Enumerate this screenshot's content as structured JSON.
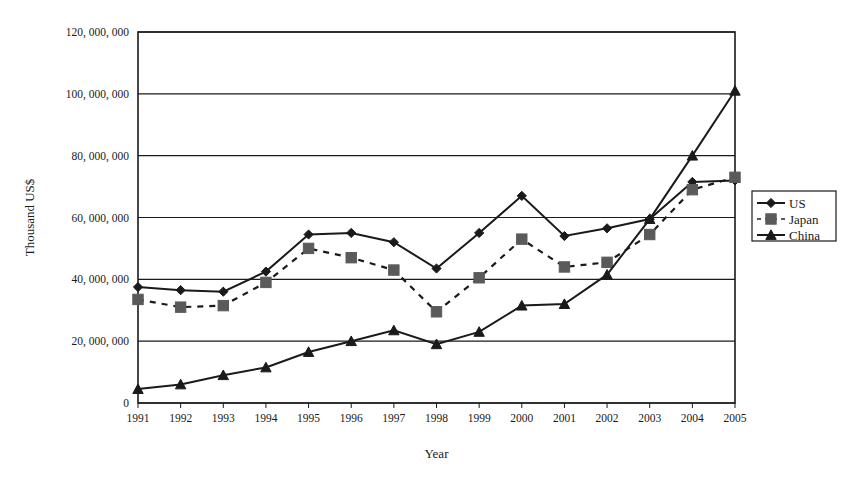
{
  "chart_data": {
    "type": "line",
    "title": "",
    "xlabel": "Year",
    "ylabel": "Thousand US$",
    "categories": [
      "1991",
      "1992",
      "1993",
      "1994",
      "1995",
      "1996",
      "1997",
      "1998",
      "1999",
      "2000",
      "2001",
      "2002",
      "2003",
      "2004",
      "2005"
    ],
    "x": [
      1991,
      1992,
      1993,
      1994,
      1995,
      1996,
      1997,
      1998,
      1999,
      2000,
      2001,
      2002,
      2003,
      2004,
      2005
    ],
    "ylim": [
      0,
      120000000
    ],
    "xlim": [
      1991,
      2005
    ],
    "ytick_labels": [
      "120, 000, 000",
      "100, 000, 000",
      "80, 000, 000",
      "60, 000, 000",
      "40, 000, 000",
      "20, 000, 000",
      "0"
    ],
    "ytick_values": [
      120000000,
      100000000,
      80000000,
      60000000,
      40000000,
      20000000,
      0
    ],
    "xtick_labels": [
      "1991",
      "1992",
      "1993",
      "1994",
      "1995",
      "1996",
      "1997",
      "1998",
      "1999",
      "2000",
      "2001",
      "2002",
      "2003",
      "2004",
      "2005"
    ],
    "grid": "horizontal",
    "legend_position": "right",
    "series": [
      {
        "name": "US",
        "marker": "diamond",
        "linestyle": "solid",
        "color": "#1a1a1a",
        "values": [
          37500000,
          36500000,
          36000000,
          42500000,
          54500000,
          55000000,
          52000000,
          43500000,
          55000000,
          67000000,
          54000000,
          56500000,
          59500000,
          71500000,
          72000000
        ]
      },
      {
        "name": "Japan",
        "marker": "square",
        "linestyle": "dashed",
        "color": "#5a5a5a",
        "values": [
          33500000,
          31000000,
          31500000,
          39000000,
          50000000,
          47000000,
          43000000,
          29500000,
          40500000,
          53000000,
          44000000,
          45500000,
          54500000,
          69000000,
          73000000
        ]
      },
      {
        "name": "China",
        "marker": "triangle",
        "linestyle": "solid",
        "color": "#1a1a1a",
        "values": [
          4500000,
          6000000,
          9000000,
          11500000,
          16500000,
          20000000,
          23500000,
          19000000,
          23000000,
          31500000,
          32000000,
          41500000,
          59500000,
          80000000,
          101000000
        ]
      }
    ]
  },
  "legend": {
    "entries": [
      {
        "label": "US"
      },
      {
        "label": "Japan"
      },
      {
        "label": "China"
      }
    ]
  }
}
